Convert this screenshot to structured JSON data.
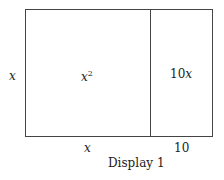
{
  "diagram": {
    "caption": "Display 1",
    "left_side_label": "x",
    "bottom_left_label": "x",
    "bottom_right_label": "10",
    "regions": [
      {
        "label_base": "x",
        "label_exp": "2"
      },
      {
        "label_num": "10",
        "label_var": "x"
      }
    ]
  }
}
